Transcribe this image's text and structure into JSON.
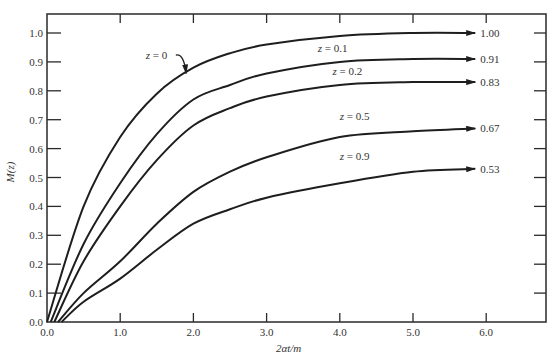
{
  "chart_data": {
    "type": "line",
    "title": "",
    "xlabel": "2αt/m",
    "ylabel": "M(z)",
    "xlim": [
      0,
      6.8
    ],
    "ylim": [
      0,
      1.05
    ],
    "grid": false,
    "legend": "inline labels on curves; asymptote values at right",
    "xticks": [
      "0.0",
      "1.0",
      "2.0",
      "3.0",
      "4.0",
      "5.0",
      "6.0"
    ],
    "yticks": [
      "0.0",
      "0.1",
      "0.2",
      "0.3",
      "0.4",
      "0.5",
      "0.6",
      "0.7",
      "0.8",
      "0.9",
      "1.0"
    ],
    "x": [
      0.0,
      0.5,
      1.0,
      1.5,
      2.0,
      2.5,
      3.0,
      4.0,
      5.0,
      5.85
    ],
    "series": [
      {
        "name": "z = 0",
        "label": "z = 0",
        "asymptote": "1.00",
        "start_x": 0.0,
        "values": [
          0.0,
          0.4,
          0.64,
          0.79,
          0.88,
          0.93,
          0.96,
          0.99,
          1.0,
          1.0
        ]
      },
      {
        "name": "z = 0.1",
        "label": "z = 0.1",
        "asymptote": "0.91",
        "start_x": 0.05,
        "values": [
          0.0,
          0.27,
          0.48,
          0.65,
          0.77,
          0.82,
          0.86,
          0.9,
          0.91,
          0.91
        ]
      },
      {
        "name": "z = 0.2",
        "label": "z = 0.2",
        "asymptote": "0.83",
        "start_x": 0.1,
        "values": [
          0.0,
          0.21,
          0.4,
          0.56,
          0.68,
          0.74,
          0.78,
          0.82,
          0.83,
          0.83
        ]
      },
      {
        "name": "z = 0.5",
        "label": "z = 0.5",
        "asymptote": "0.67",
        "start_x": 0.15,
        "values": [
          0.0,
          0.1,
          0.21,
          0.34,
          0.45,
          0.52,
          0.57,
          0.64,
          0.66,
          0.67
        ]
      },
      {
        "name": "z = 0.9",
        "label": "z = 0.9",
        "asymptote": "0.53",
        "start_x": 0.2,
        "values": [
          0.0,
          0.07,
          0.15,
          0.25,
          0.34,
          0.39,
          0.43,
          0.48,
          0.52,
          0.53
        ]
      }
    ],
    "annotations": [
      {
        "text": "z = 0",
        "x": 1.35,
        "y": 0.91,
        "arrow_to": [
          1.9,
          0.86
        ]
      },
      {
        "text": "z = 0.1",
        "x": 3.7,
        "y": 0.935
      },
      {
        "text": "z = 0.2",
        "x": 3.9,
        "y": 0.855
      },
      {
        "text": "z = 0.5",
        "x": 4.0,
        "y": 0.7
      },
      {
        "text": "z = 0.9",
        "x": 4.0,
        "y": 0.56
      }
    ]
  },
  "layout": {
    "plot": {
      "left": 47,
      "right": 546,
      "top": 14,
      "bottom": 322
    },
    "x_px_per_unit": 73.2,
    "y_px_per_unit": 289,
    "line_color": "#1e1e1e"
  }
}
